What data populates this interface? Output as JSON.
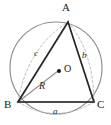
{
  "figure": {
    "canvas": {
      "width": 111,
      "height": 125,
      "background": "#ffffff"
    },
    "colors": {
      "circle_stroke": "#8a8a8a",
      "triangle_stroke": "#262626",
      "dashed_stroke": "#b0b0b0",
      "radius_stroke": "#8a8a8a",
      "label_text": "#1a1a1a",
      "side_label_text": "#2b2b2b",
      "center_dot": "#111111"
    },
    "vertices": [
      {
        "name": "A",
        "label": "A",
        "x": 68,
        "y": 22,
        "label_x": 64,
        "label_y": 5
      },
      {
        "name": "B",
        "label": "B",
        "x": 18,
        "y": 102,
        "label_x": 5,
        "label_y": 103
      },
      {
        "name": "C",
        "label": "C",
        "x": 94,
        "y": 102,
        "label_x": 97,
        "label_y": 103
      }
    ],
    "center": {
      "name": "O",
      "label": "O",
      "x": 59,
      "y": 71,
      "label_x": 64,
      "label_y": 65,
      "dot_radius": 2.0
    },
    "circle": {
      "cx": 56,
      "cy": 68,
      "r": 46
    },
    "sides": [
      {
        "name": "a",
        "label": "a",
        "between": "B-C",
        "label_x": 53,
        "label_y": 110
      },
      {
        "name": "b",
        "label": "b",
        "between": "A-C",
        "label_x": 83,
        "label_y": 54
      },
      {
        "name": "c",
        "label": "c",
        "between": "A-B",
        "label_x": 35,
        "label_y": 52
      }
    ],
    "radius": {
      "name": "R",
      "label": "R",
      "from": "B",
      "to": "O",
      "label_x": 41,
      "label_y": 84
    },
    "arcs": [
      {
        "name": "arc-a",
        "style": "dashed",
        "description": "dashed arc bulging below side BC"
      },
      {
        "name": "arc-b",
        "style": "dashed",
        "description": "dashed arc bulging right of side AC"
      },
      {
        "name": "arc-c",
        "style": "dashed",
        "description": "dashed arc bulging left of side AB"
      }
    ]
  }
}
